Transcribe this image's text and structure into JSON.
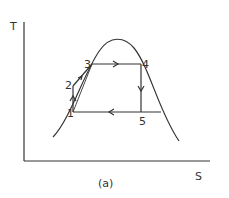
{
  "diagram": {
    "type": "T-S diagram (vapor cycle)",
    "axes": {
      "y_label": "T",
      "x_label": "S"
    },
    "caption": "(a)",
    "points": [
      {
        "id": "1",
        "label": "1"
      },
      {
        "id": "2",
        "label": "2"
      },
      {
        "id": "3",
        "label": "3"
      },
      {
        "id": "4",
        "label": "4"
      },
      {
        "id": "5",
        "label": "5"
      }
    ],
    "processes": [
      {
        "from": "1",
        "to": "2",
        "direction": "up"
      },
      {
        "from": "2",
        "to": "3",
        "direction": "up-right"
      },
      {
        "from": "3",
        "to": "4",
        "direction": "right"
      },
      {
        "from": "4",
        "to": "5",
        "direction": "down"
      },
      {
        "from": "5",
        "to": "1",
        "direction": "left"
      }
    ],
    "colors": {
      "stroke": "#333333",
      "background": "#ffffff"
    }
  }
}
